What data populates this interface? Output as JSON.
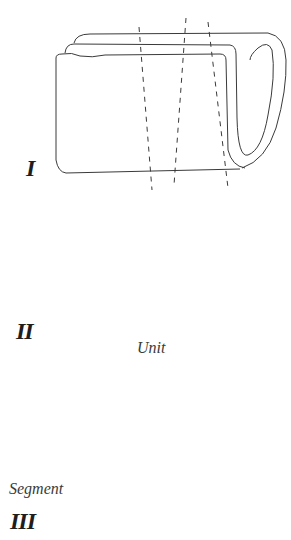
{
  "figure": {
    "panels": [
      {
        "id": "I",
        "label": "I",
        "description": "Rolled / folded sheet with three dashed cut lines"
      },
      {
        "id": "II",
        "label": "II",
        "caption": "Unit",
        "description": "Flattened unit with two dotted stripes"
      },
      {
        "id": "III",
        "label": "III",
        "caption": "Segment",
        "description": "Unit crossed by dashed lines marking segments"
      }
    ]
  },
  "colors": {
    "line": "#3a3a3a",
    "background": "#ffffff",
    "stipple": "#4a4a4a"
  }
}
